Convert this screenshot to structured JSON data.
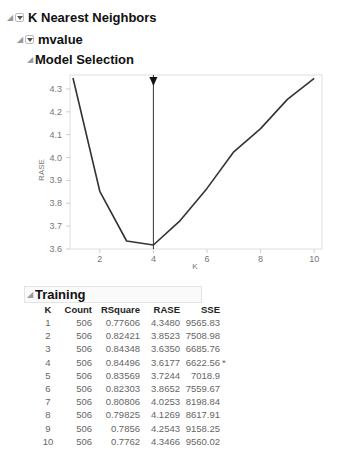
{
  "outline": {
    "root": {
      "label": "K Nearest Neighbors"
    },
    "response": {
      "label": "mvalue"
    },
    "model_selection": {
      "label": "Model Selection"
    },
    "training": {
      "label": "Training"
    }
  },
  "chart_data": {
    "type": "line",
    "title": "Model Selection",
    "xlabel": "K",
    "ylabel": "RASE",
    "x": [
      1,
      2,
      3,
      4,
      5,
      6,
      7,
      8,
      9,
      10
    ],
    "series": [
      {
        "name": "RASE",
        "values": [
          4.348,
          3.8523,
          3.635,
          3.6177,
          3.7244,
          3.8652,
          4.0253,
          4.1269,
          4.2543,
          4.3466
        ]
      }
    ],
    "xlim": [
      0.9,
      10.1
    ],
    "ylim": [
      3.6,
      4.35
    ],
    "x_ticks": [
      "2",
      "4",
      "6",
      "8",
      "10"
    ],
    "y_ticks": [
      "3.6",
      "3.7",
      "3.8",
      "3.9",
      "4.0",
      "4.1",
      "4.2",
      "4.3"
    ],
    "selected_k": 4,
    "grid": false,
    "legend": "none"
  },
  "training_table": {
    "columns": [
      "K",
      "Count",
      "RSquare",
      "RASE",
      "SSE",
      ""
    ],
    "rows": [
      [
        "1",
        "506",
        "0.77606",
        "4.3480",
        "9565.83",
        ""
      ],
      [
        "2",
        "506",
        "0.82421",
        "3.8523",
        "7508.98",
        ""
      ],
      [
        "3",
        "506",
        "0.84348",
        "3.6350",
        "6685.76",
        ""
      ],
      [
        "4",
        "506",
        "0.84496",
        "3.6177",
        "6622.56",
        "*"
      ],
      [
        "5",
        "506",
        "0.83569",
        "3.7244",
        "7018.9",
        ""
      ],
      [
        "6",
        "506",
        "0.82303",
        "3.8652",
        "7559.67",
        ""
      ],
      [
        "7",
        "506",
        "0.80806",
        "4.0253",
        "8198.84",
        ""
      ],
      [
        "8",
        "506",
        "0.79825",
        "4.1269",
        "8617.91",
        ""
      ],
      [
        "9",
        "506",
        "0.7856",
        "4.2543",
        "9158.25",
        ""
      ],
      [
        "10",
        "506",
        "0.7762",
        "4.3466",
        "9560.02",
        ""
      ]
    ]
  },
  "colors": {
    "line": "#333333",
    "axis": "#d8d8d8",
    "tick_text": "#777777",
    "selector": "#222222"
  }
}
